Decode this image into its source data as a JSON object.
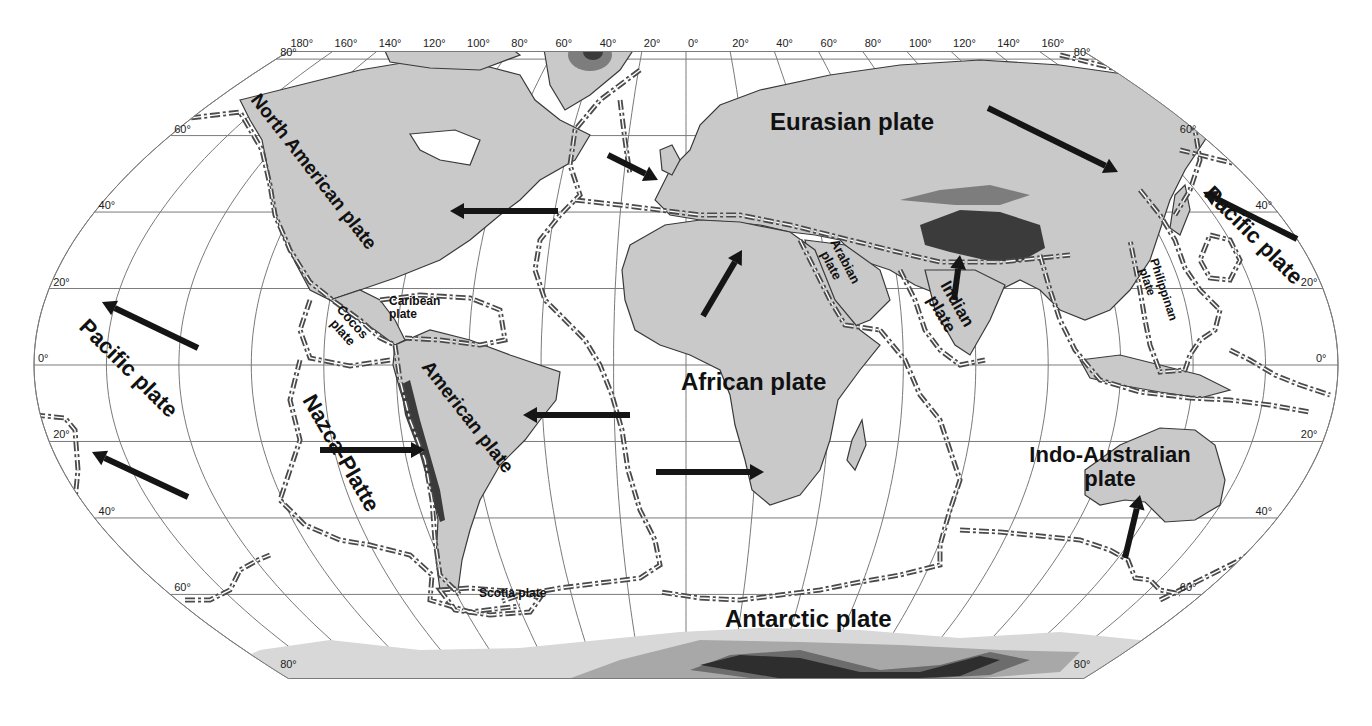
{
  "map": {
    "projection": "robinson-like",
    "colors": {
      "land": "#c9c9c9",
      "mountains": "#3b3b3b",
      "ocean": "#ffffff",
      "graticule": "#7a7a7a",
      "boundary": "#4a4a4a",
      "label": "#111111"
    },
    "longitude_labels": {
      "west": [
        "180°",
        "160°",
        "140°",
        "120°",
        "100°",
        "80°",
        "60°",
        "40°",
        "20°",
        "0°"
      ],
      "east": [
        "20°",
        "40°",
        "60°",
        "80°",
        "100°",
        "120°",
        "140°",
        "160°"
      ]
    },
    "latitude_labels": {
      "left": [
        "80°",
        "60°",
        "40°",
        "20°",
        "0°",
        "20°",
        "40°",
        "60°",
        "80°"
      ],
      "right": [
        "80°",
        "60°",
        "40°",
        "20°",
        "0°",
        "20°",
        "40°",
        "60°",
        "80°"
      ]
    },
    "plates": [
      {
        "id": "north-american",
        "label": "North American plate",
        "x": 250,
        "y": 100,
        "size": 19,
        "rotate": 52
      },
      {
        "id": "eurasian",
        "label": "Eurasian plate",
        "x": 770,
        "y": 130,
        "size": 24,
        "rotate": 0
      },
      {
        "id": "pacific-west",
        "label": "Pacific plate",
        "x": 78,
        "y": 328,
        "size": 22,
        "rotate": 45
      },
      {
        "id": "pacific-east",
        "label": "Pacific plate",
        "x": 1203,
        "y": 195,
        "size": 22,
        "rotate": 45
      },
      {
        "id": "caribean",
        "label": "Caribean plate",
        "x": 389,
        "y": 305,
        "size": 12,
        "rotate": 0,
        "line2": "plate",
        "line1": "Caribean"
      },
      {
        "id": "cocos",
        "label": "Cocos plate",
        "x": 336,
        "y": 310,
        "size": 13,
        "rotate": 48,
        "line1": "Cocos",
        "line2": "plate"
      },
      {
        "id": "nazca",
        "label": "Nazca-Platte",
        "x": 302,
        "y": 400,
        "size": 22,
        "rotate": 60
      },
      {
        "id": "south-american",
        "label": "American plate",
        "x": 421,
        "y": 367,
        "size": 19,
        "rotate": 52
      },
      {
        "id": "african",
        "label": "African plate",
        "x": 681,
        "y": 390,
        "size": 24,
        "rotate": 0
      },
      {
        "id": "arabian",
        "label": "Arabian plate",
        "x": 830,
        "y": 242,
        "size": 13,
        "rotate": 62,
        "line1": "Arabian",
        "line2": "plate"
      },
      {
        "id": "indian",
        "label": "Indian plate",
        "x": 940,
        "y": 285,
        "size": 17,
        "rotate": 60,
        "line1": "Indian",
        "line2": "plate"
      },
      {
        "id": "philippine",
        "label": "Philippinan plate",
        "x": 1150,
        "y": 260,
        "size": 12,
        "rotate": 72,
        "line1": "Philippinan",
        "line2": "plate"
      },
      {
        "id": "indo-australian",
        "label": "Indo-Australian plate",
        "x": 1110,
        "y": 462,
        "size": 22,
        "rotate": 0,
        "line1": "Indo-Australian",
        "line2": "plate"
      },
      {
        "id": "scotia",
        "label": "Scotia plate",
        "x": 479,
        "y": 597,
        "size": 12,
        "rotate": 0
      },
      {
        "id": "antarctic",
        "label": "Antarctic plate",
        "x": 725,
        "y": 627,
        "size": 24,
        "rotate": 0
      }
    ],
    "arrows": [
      {
        "id": "pacific-nw-1",
        "x1": 198,
        "y1": 348,
        "x2": 102,
        "y2": 302
      },
      {
        "id": "pacific-nw-2",
        "x1": 188,
        "y1": 497,
        "x2": 92,
        "y2": 452
      },
      {
        "id": "north-american-west",
        "x1": 558,
        "y1": 211,
        "x2": 450,
        "y2": 211
      },
      {
        "id": "eurasian-se-1",
        "x1": 608,
        "y1": 155,
        "x2": 658,
        "y2": 180
      },
      {
        "id": "eurasian-se-2",
        "x1": 988,
        "y1": 108,
        "x2": 1118,
        "y2": 172
      },
      {
        "id": "pacific-east-nw",
        "x1": 1297,
        "y1": 239,
        "x2": 1203,
        "y2": 192
      },
      {
        "id": "african-ne",
        "x1": 703,
        "y1": 316,
        "x2": 742,
        "y2": 250
      },
      {
        "id": "indian-north",
        "x1": 954,
        "y1": 300,
        "x2": 960,
        "y2": 255
      },
      {
        "id": "south-american-west",
        "x1": 630,
        "y1": 415,
        "x2": 523,
        "y2": 415
      },
      {
        "id": "nazca-east",
        "x1": 320,
        "y1": 450,
        "x2": 425,
        "y2": 450
      },
      {
        "id": "african-east",
        "x1": 656,
        "y1": 472,
        "x2": 764,
        "y2": 472
      },
      {
        "id": "indo-australian-north",
        "x1": 1125,
        "y1": 558,
        "x2": 1140,
        "y2": 495
      }
    ]
  }
}
